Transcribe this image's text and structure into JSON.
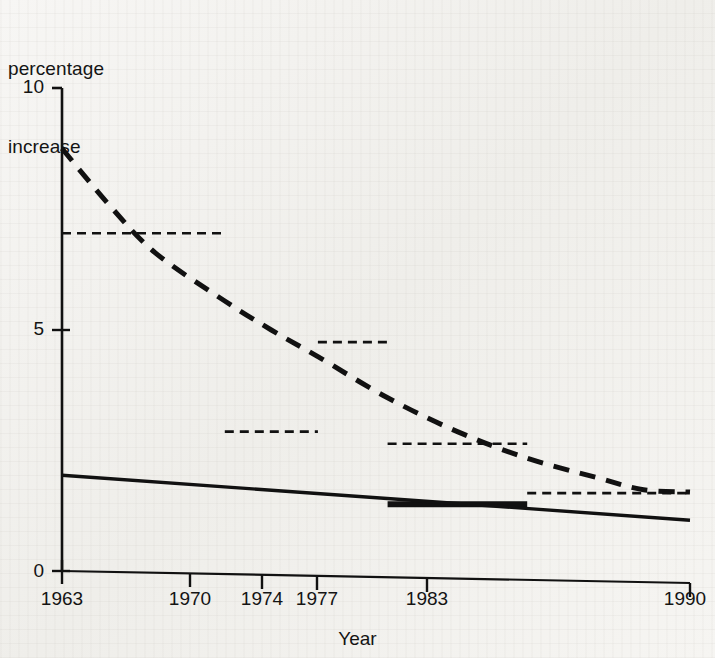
{
  "figure": {
    "y_axis_caption_line1": "percentage",
    "y_axis_caption_line2": "increase",
    "x_axis_title": "Year",
    "ytick_labels": [
      "10",
      "5",
      "0"
    ],
    "xtick_labels": [
      "1963",
      "1970",
      "1974",
      "1977",
      "1983",
      "1990"
    ],
    "line_color": "#111111",
    "background_color": "#f4f3f1"
  },
  "chart_data": {
    "type": "line",
    "title": "",
    "xlabel": "Year",
    "ylabel": "percentage increase",
    "xlim": [
      1963,
      1990
    ],
    "ylim": [
      0,
      10
    ],
    "yticks": [
      0,
      5,
      10
    ],
    "xticks": [
      1963,
      1970,
      1974,
      1977,
      1983,
      1990
    ],
    "grid": false,
    "legend": "none",
    "series": [
      {
        "name": "percentage increase (dashed curve)",
        "style": "dashed",
        "x": [
          1963,
          1965,
          1967,
          1970,
          1972,
          1974,
          1977,
          1980,
          1983,
          1986,
          1988,
          1990
        ],
        "values": [
          8.75,
          7.6,
          6.6,
          5.6,
          5.0,
          4.45,
          3.6,
          2.9,
          2.35,
          1.95,
          1.7,
          1.65
        ]
      },
      {
        "name": "trend (solid line)",
        "style": "solid",
        "x": [
          1963,
          1990
        ],
        "values": [
          2.0,
          1.07
        ]
      },
      {
        "name": "period averages (dashed step segments)",
        "style": "dashed-segments",
        "segments": [
          {
            "x_start": 1963,
            "x_end": 1970,
            "value": 7.0
          },
          {
            "x_start": 1970,
            "x_end": 1974,
            "value": 2.9
          },
          {
            "x_start": 1974,
            "x_end": 1977,
            "value": 4.75
          },
          {
            "x_start": 1977,
            "x_end": 1983,
            "value": 2.65
          },
          {
            "x_start": 1983,
            "x_end": 1990,
            "value": 1.63
          }
        ]
      },
      {
        "name": "bold sub-segment (solid)",
        "style": "solid-bold-segment",
        "segments": [
          {
            "x_start": 1977,
            "x_end": 1983,
            "value": 1.4
          }
        ]
      }
    ]
  }
}
